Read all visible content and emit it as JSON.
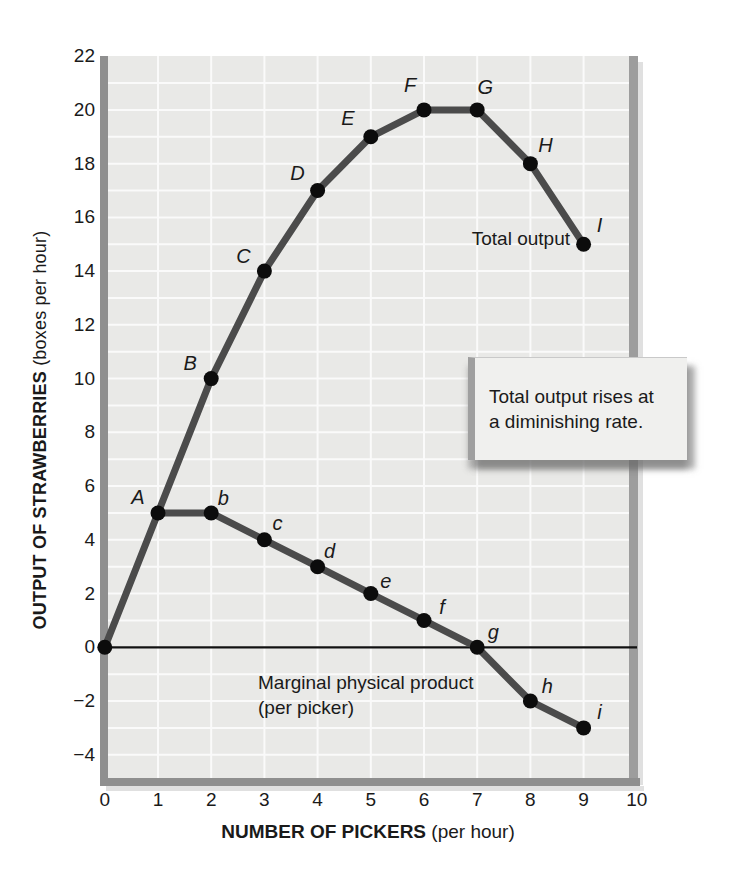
{
  "axes": {
    "y_title": "OUTPUT OF STRAWBERRIES",
    "y_title_unit": " (boxes per hour)",
    "x_title": "NUMBER OF PICKERS",
    "x_title_unit": " (per hour)",
    "x_tick_labels": [
      "0",
      "1",
      "2",
      "3",
      "4",
      "5",
      "6",
      "7",
      "8",
      "9",
      "10"
    ],
    "y_tick_labels": [
      "22",
      "20",
      "18",
      "16",
      "14",
      "12",
      "10",
      "8",
      "6",
      "4",
      "2",
      "0",
      "−2",
      "−4"
    ],
    "y_tick_values": [
      22,
      20,
      18,
      16,
      14,
      12,
      10,
      8,
      6,
      4,
      2,
      0,
      -2,
      -4
    ],
    "x_tick_values": [
      0,
      1,
      2,
      3,
      4,
      5,
      6,
      7,
      8,
      9,
      10
    ]
  },
  "callout": {
    "line1": "Total output rises at",
    "line2": "a diminishing rate."
  },
  "colors": {
    "plot_bg": "#e9e9e7",
    "grid": "#fafafa",
    "curve": "#4b4b4b",
    "dot": "#0c0c0c",
    "axis_bar": "#8f8f8f",
    "axis_bar_light": "#9d9d9d",
    "zero_line": "#111111",
    "shadow": "#d8d8d8",
    "text": "#1a1a1a",
    "callout_bg": "#f0f0ee",
    "callout_shadow": "#9f9f9f"
  },
  "chart_data": {
    "type": "line",
    "title": "",
    "xlabel": "NUMBER OF PICKERS (per hour)",
    "ylabel": "OUTPUT OF STRAWBERRIES (boxes per hour)",
    "xlim": [
      0,
      10
    ],
    "ylim": [
      -5,
      22
    ],
    "x_ticks": [
      0,
      1,
      2,
      3,
      4,
      5,
      6,
      7,
      8,
      9,
      10
    ],
    "y_ticks": [
      -4,
      -2,
      0,
      2,
      4,
      6,
      8,
      10,
      12,
      14,
      16,
      18,
      20,
      22
    ],
    "grid": "1-unit white grid on light gray panel",
    "legend_position": "inline curve labels",
    "series": [
      {
        "name": "Total output",
        "points": [
          {
            "x": 0,
            "y": 0
          },
          {
            "x": 1,
            "y": 5,
            "label": "A",
            "dx": -20,
            "dy": -16
          },
          {
            "x": 2,
            "y": 10,
            "label": "B",
            "dx": -21,
            "dy": -16
          },
          {
            "x": 3,
            "y": 14,
            "label": "C",
            "dx": -21,
            "dy": -15
          },
          {
            "x": 4,
            "y": 17,
            "label": "D",
            "dx": -20,
            "dy": -18
          },
          {
            "x": 5,
            "y": 19,
            "label": "E",
            "dx": -23,
            "dy": -19
          },
          {
            "x": 6,
            "y": 20,
            "label": "F",
            "dx": -14,
            "dy": -25
          },
          {
            "x": 7,
            "y": 20,
            "label": "G",
            "dx": 8,
            "dy": -23
          },
          {
            "x": 8,
            "y": 18,
            "label": "H",
            "dx": 15,
            "dy": -19
          },
          {
            "x": 9,
            "y": 15,
            "label": "I",
            "dx": 16,
            "dy": -19
          }
        ]
      },
      {
        "name": "Marginal physical product (per picker)",
        "points": [
          {
            "x": 1,
            "y": 5
          },
          {
            "x": 2,
            "y": 5,
            "label": "b",
            "dx": 12,
            "dy": -15
          },
          {
            "x": 3,
            "y": 4,
            "label": "c",
            "dx": 13,
            "dy": -17
          },
          {
            "x": 4,
            "y": 3,
            "label": "d",
            "dx": 12,
            "dy": -16
          },
          {
            "x": 5,
            "y": 2,
            "label": "e",
            "dx": 15,
            "dy": -13
          },
          {
            "x": 6,
            "y": 1,
            "label": "f",
            "dx": 18,
            "dy": -13
          },
          {
            "x": 7,
            "y": 0,
            "label": "g",
            "dx": 16,
            "dy": -15
          },
          {
            "x": 8,
            "y": -2,
            "label": "h",
            "dx": 17,
            "dy": -15
          },
          {
            "x": 9,
            "y": -3,
            "label": "i",
            "dx": 16,
            "dy": -16
          }
        ]
      }
    ],
    "annotations": {
      "total_output_label": "Total output",
      "mpp_label_line1": "Marginal physical product",
      "mpp_label_line2": "(per picker)"
    }
  }
}
